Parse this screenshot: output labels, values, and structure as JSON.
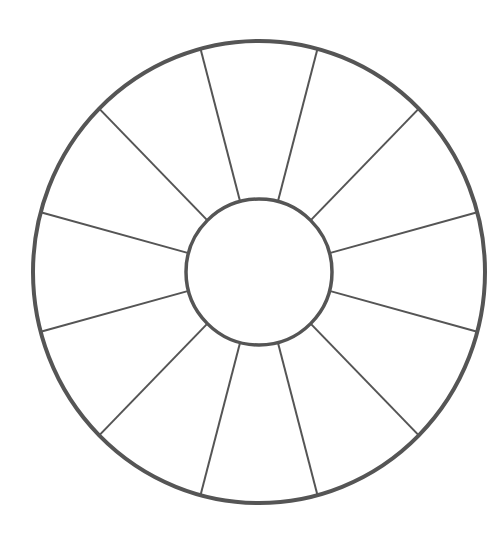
{
  "diagram": {
    "type": "segmented-wheel",
    "segments": 12,
    "center": [
      259,
      272
    ],
    "outer_radius_x": 226,
    "outer_radius_y": 231,
    "inner_radius": 73,
    "spoke_start_angle_deg": 15,
    "stroke_color": "#555555",
    "outer_stroke_width": 4,
    "inner_stroke_width": 3.5,
    "spoke_stroke_width": 2,
    "fill": "#ffffff",
    "labels": []
  }
}
